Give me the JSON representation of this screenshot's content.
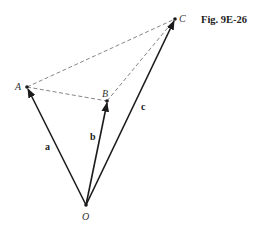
{
  "figure": {
    "caption": "Fig. 9E-26"
  },
  "points": {
    "O": {
      "label": "O",
      "x": 86,
      "y": 205
    },
    "A": {
      "label": "A",
      "x": 27,
      "y": 87
    },
    "B": {
      "label": "B",
      "x": 107,
      "y": 101
    },
    "C": {
      "label": "C",
      "x": 175,
      "y": 19
    }
  },
  "vectors": [
    {
      "label": "a",
      "from": "O",
      "to": "A"
    },
    {
      "label": "b",
      "from": "O",
      "to": "B"
    },
    {
      "label": "c",
      "from": "O",
      "to": "C"
    }
  ],
  "dashed_segments": [
    {
      "from": "A",
      "to": "B"
    },
    {
      "from": "B",
      "to": "C"
    },
    {
      "from": "A",
      "to": "C"
    }
  ],
  "colors": {
    "line": "#1a1a1a",
    "dashed": "#666666",
    "background": "#ffffff"
  }
}
